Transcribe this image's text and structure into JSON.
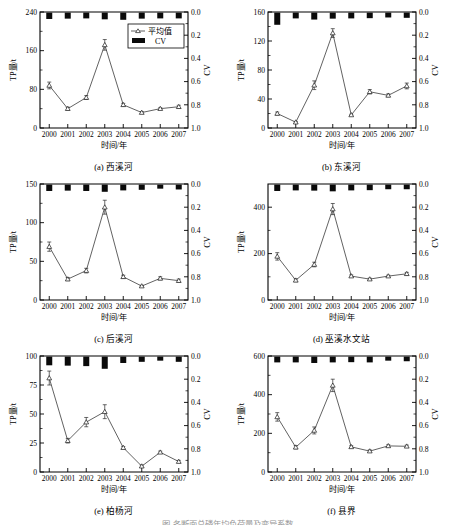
{
  "figure": {
    "caption": "图 各断面总磷年均负荷量及变异系数",
    "x_tick_labels": [
      "2000",
      "2001",
      "2002",
      "2003",
      "2004",
      "2005",
      "2006",
      "2007"
    ],
    "xlabel": "时间/年",
    "ylabel_left": "TP量/t",
    "ylabel_right": "CV",
    "cv_ticks": [
      "0.0",
      "0.2",
      "0.4",
      "0.6",
      "0.8",
      "1.0"
    ],
    "legend": {
      "mean": "平均值",
      "cv": "CV"
    }
  },
  "chart_data": [
    {
      "type": "line",
      "panel": "a",
      "title": "(a) 西溪河",
      "xlabel": "时间/年",
      "ylabel": "TP量/t",
      "y2label": "CV",
      "x": [
        "2000",
        "2001",
        "2002",
        "2003",
        "2004",
        "2005",
        "2006",
        "2007"
      ],
      "categories": [
        "2000",
        "2001",
        "2002",
        "2003",
        "2004",
        "2005",
        "2006",
        "2007"
      ],
      "ylim": [
        0,
        240
      ],
      "yticks": [
        0,
        80,
        160,
        240
      ],
      "y2lim": [
        1.0,
        0.0
      ],
      "y2ticks": [
        0.0,
        0.2,
        0.4,
        0.6,
        0.8,
        1.0
      ],
      "grid": false,
      "legend_position": "upper-right",
      "series": [
        {
          "name": "平均值",
          "values": [
            88,
            40,
            63,
            172,
            48,
            32,
            40,
            44
          ],
          "errors": [
            7,
            3,
            4,
            11,
            3,
            2,
            2,
            3
          ]
        },
        {
          "name": "CV",
          "values": [
            0.055,
            0.052,
            0.05,
            0.058,
            0.062,
            0.052,
            0.05,
            0.05
          ]
        }
      ]
    },
    {
      "type": "line",
      "panel": "b",
      "title": "(b) 东溪河",
      "xlabel": "时间/年",
      "ylabel": "TP量/t",
      "y2label": "CV",
      "x": [
        "2000",
        "2001",
        "2002",
        "2003",
        "2004",
        "2005",
        "2006",
        "2007"
      ],
      "categories": [
        "2000",
        "2001",
        "2002",
        "2003",
        "2004",
        "2005",
        "2006",
        "2007"
      ],
      "ylim": [
        0,
        160
      ],
      "yticks": [
        0,
        40,
        80,
        120,
        160
      ],
      "y2lim": [
        1.0,
        0.0
      ],
      "y2ticks": [
        0.0,
        0.2,
        0.4,
        0.6,
        0.8,
        1.0
      ],
      "grid": false,
      "legend_position": "none",
      "series": [
        {
          "name": "平均值",
          "values": [
            20,
            8,
            59,
            131,
            18,
            50,
            45,
            58
          ],
          "errors": [
            2,
            1,
            6,
            6,
            1,
            3,
            2,
            4
          ]
        },
        {
          "name": "CV",
          "values": [
            0.105,
            0.05,
            0.06,
            0.052,
            0.05,
            0.048,
            0.042,
            0.045
          ]
        }
      ]
    },
    {
      "type": "line",
      "panel": "c",
      "title": "(c) 后溪河",
      "xlabel": "时间/年",
      "ylabel": "TP量/t",
      "y2label": "CV",
      "x": [
        "2000",
        "2001",
        "2002",
        "2003",
        "2004",
        "2005",
        "2006",
        "2007"
      ],
      "categories": [
        "2000",
        "2001",
        "2002",
        "2003",
        "2004",
        "2005",
        "2006",
        "2007"
      ],
      "ylim": [
        0,
        150
      ],
      "yticks": [
        0,
        50,
        100,
        150
      ],
      "y2lim": [
        1.0,
        0.0
      ],
      "y2ticks": [
        0.0,
        0.2,
        0.4,
        0.6,
        0.8,
        1.0
      ],
      "grid": false,
      "legend_position": "none",
      "series": [
        {
          "name": "平均值",
          "values": [
            69,
            27,
            38,
            120,
            30,
            18,
            28,
            25
          ],
          "errors": [
            6,
            2,
            3,
            9,
            2,
            1,
            2,
            2
          ]
        },
        {
          "name": "CV",
          "values": [
            0.055,
            0.052,
            0.055,
            0.062,
            0.05,
            0.045,
            0.035,
            0.042
          ]
        }
      ]
    },
    {
      "type": "line",
      "panel": "d",
      "title": "(d) 巫溪水文站",
      "xlabel": "时间/年",
      "ylabel": "TP量/t",
      "y2label": "CV",
      "x": [
        "2000",
        "2001",
        "2002",
        "2003",
        "2004",
        "2005",
        "2006",
        "2007"
      ],
      "categories": [
        "2000",
        "2001",
        "2002",
        "2003",
        "2004",
        "2005",
        "2006",
        "2007"
      ],
      "ylim": [
        0,
        500
      ],
      "yticks": [
        0,
        200,
        400
      ],
      "y2lim": [
        1.0,
        0.0
      ],
      "y2ticks": [
        0.0,
        0.2,
        0.4,
        0.6,
        0.8,
        1.0
      ],
      "grid": false,
      "legend_position": "none",
      "series": [
        {
          "name": "平均值",
          "values": [
            188,
            85,
            153,
            392,
            103,
            90,
            103,
            113
          ],
          "errors": [
            16,
            6,
            10,
            24,
            5,
            4,
            4,
            6
          ]
        },
        {
          "name": "CV",
          "values": [
            0.055,
            0.05,
            0.052,
            0.058,
            0.05,
            0.048,
            0.04,
            0.04
          ]
        }
      ]
    },
    {
      "type": "line",
      "panel": "e",
      "title": "(e) 柏杨河",
      "xlabel": "时间/年",
      "ylabel": "TP量/t",
      "y2label": "CV",
      "x": [
        "2000",
        "2001",
        "2002",
        "2003",
        "2004",
        "2005",
        "2006",
        "2007"
      ],
      "categories": [
        "2000",
        "2001",
        "2002",
        "2003",
        "2004",
        "2005",
        "2006",
        "2007"
      ],
      "ylim": [
        0,
        100
      ],
      "yticks": [
        0,
        25,
        50,
        75,
        100
      ],
      "y2lim": [
        1.0,
        0.0
      ],
      "y2ticks": [
        0.0,
        0.2,
        0.4,
        0.6,
        0.8,
        1.0
      ],
      "grid": false,
      "legend_position": "none",
      "series": [
        {
          "name": "平均值",
          "values": [
            81,
            27,
            43,
            52,
            21,
            5,
            17,
            9
          ],
          "errors": [
            6,
            2,
            4,
            6,
            1,
            1,
            1,
            1
          ]
        },
        {
          "name": "CV",
          "values": [
            0.075,
            0.078,
            0.082,
            0.105,
            0.055,
            0.045,
            0.035,
            0.045
          ]
        }
      ]
    },
    {
      "type": "line",
      "panel": "f",
      "title": "(f) 县界",
      "xlabel": "时间/年",
      "ylabel": "TP量/t",
      "y2label": "CV",
      "x": [
        "2000",
        "2001",
        "2002",
        "2003",
        "2004",
        "2005",
        "2006",
        "2007"
      ],
      "categories": [
        "2000",
        "2001",
        "2002",
        "2003",
        "2004",
        "2005",
        "2006",
        "2007"
      ],
      "ylim": [
        0,
        600
      ],
      "yticks": [
        0,
        200,
        400,
        600
      ],
      "y2lim": [
        1.0,
        0.0
      ],
      "y2ticks": [
        0.0,
        0.2,
        0.4,
        0.6,
        0.8,
        1.0
      ],
      "grid": false,
      "legend_position": "none",
      "series": [
        {
          "name": "平均值",
          "values": [
            285,
            128,
            215,
            448,
            130,
            108,
            135,
            133
          ],
          "errors": [
            22,
            8,
            18,
            32,
            6,
            6,
            6,
            6
          ]
        },
        {
          "name": "CV",
          "values": [
            0.05,
            0.05,
            0.055,
            0.05,
            0.048,
            0.05,
            0.035,
            0.04
          ]
        }
      ]
    }
  ]
}
